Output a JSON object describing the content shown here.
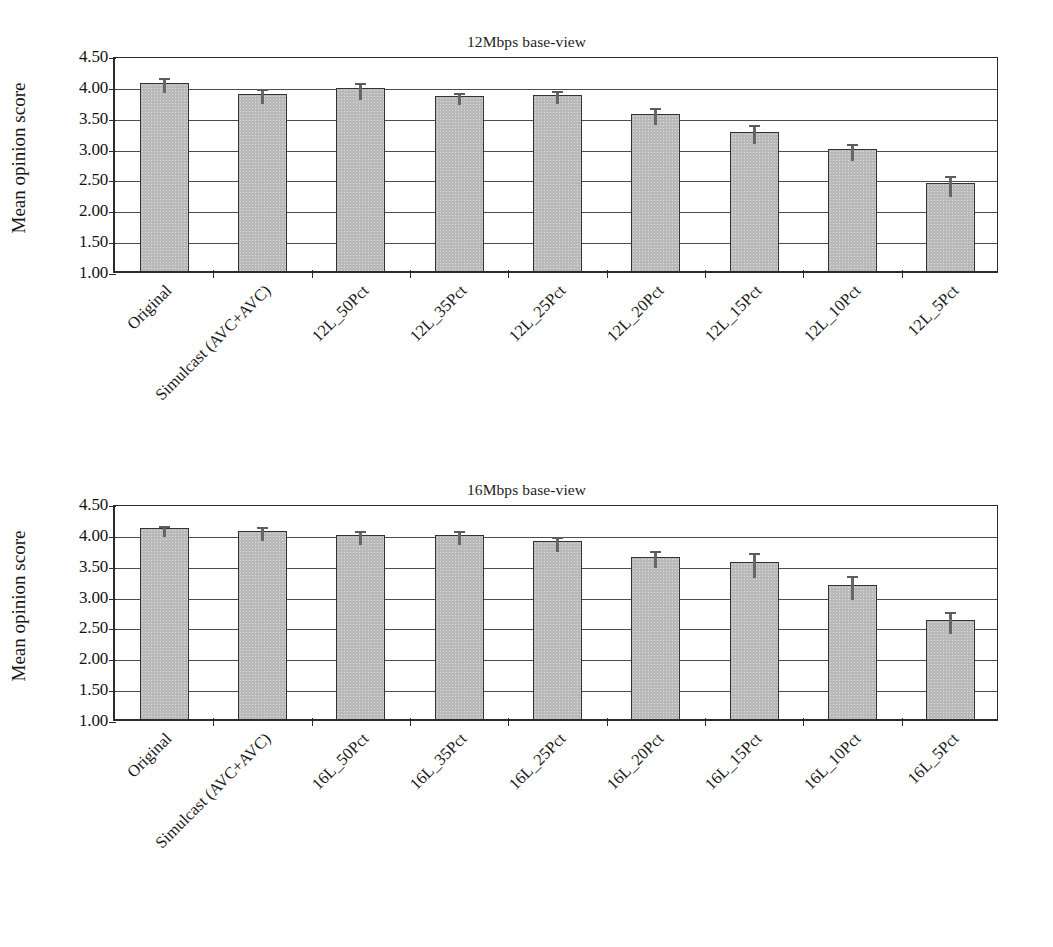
{
  "figure": {
    "ylabel": "Mean opinion score",
    "yticks": [
      "1.00",
      "1.50",
      "2.00",
      "2.50",
      "3.00",
      "3.50",
      "4.00",
      "4.50"
    ]
  },
  "chart_data": [
    {
      "type": "bar",
      "title": "12Mbps base-view",
      "xlabel": "",
      "ylabel": "Mean opinion score",
      "ylim": [
        1.0,
        4.5
      ],
      "ytick_values": [
        1.0,
        1.5,
        2.0,
        2.5,
        3.0,
        3.5,
        4.0,
        4.5
      ],
      "grid": true,
      "legend": "none",
      "categories": [
        "Original",
        "Simulcast (AVC+AVC)",
        "12L_50Pct",
        "12L_35Pct",
        "12L_25Pct",
        "12L_20Pct",
        "12L_15Pct",
        "12L_10Pct",
        "12L_5Pct"
      ],
      "values": [
        4.05,
        3.87,
        3.96,
        3.84,
        3.86,
        3.55,
        3.26,
        2.97,
        2.42
      ],
      "errors": [
        0.12,
        0.12,
        0.14,
        0.1,
        0.11,
        0.14,
        0.16,
        0.14,
        0.17
      ]
    },
    {
      "type": "bar",
      "title": "16Mbps base-view",
      "xlabel": "",
      "ylabel": "Mean opinion score",
      "ylim": [
        1.0,
        4.5
      ],
      "ytick_values": [
        1.0,
        1.5,
        2.0,
        2.5,
        3.0,
        3.5,
        4.0,
        4.5
      ],
      "grid": true,
      "legend": "none",
      "categories": [
        "Original",
        "Simulcast (AVC+AVC)",
        "16L_50Pct",
        "16L_35Pct",
        "16L_25Pct",
        "16L_20Pct",
        "16L_15Pct",
        "16L_10Pct",
        "16L_5Pct"
      ],
      "values": [
        4.09,
        4.05,
        3.98,
        3.98,
        3.88,
        3.63,
        3.54,
        3.17,
        2.6
      ],
      "errors": [
        0.09,
        0.11,
        0.12,
        0.11,
        0.12,
        0.14,
        0.2,
        0.2,
        0.18
      ]
    }
  ],
  "colors": {
    "bar_fill": "#b9b9b9",
    "bar_edge": "#333333",
    "error_bar": "#5c5c5c",
    "grid": "#4d4d4d",
    "axis": "#2b2b2b",
    "text": "#1a1a1a",
    "background": "#ffffff"
  }
}
